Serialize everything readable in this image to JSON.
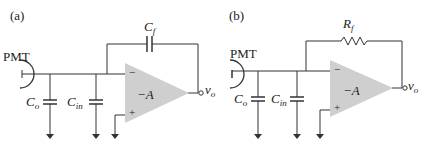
{
  "panels": [
    {
      "label": "(a)",
      "source": "PMT",
      "feedback": {
        "symbol": "C",
        "sub": "f",
        "type": "capacitor"
      },
      "caps": [
        {
          "symbol": "C",
          "sub": "o"
        },
        {
          "symbol": "C",
          "sub": "in"
        }
      ],
      "amp_gain": "−A",
      "minus": "−",
      "plus": "+",
      "output": {
        "symbol": "v",
        "sub": "o"
      }
    },
    {
      "label": "(b)",
      "source": "PMT",
      "feedback": {
        "symbol": "R",
        "sub": "f",
        "type": "resistor"
      },
      "caps": [
        {
          "symbol": "C",
          "sub": "o"
        },
        {
          "symbol": "C",
          "sub": "in"
        }
      ],
      "amp_gain": "−A",
      "minus": "−",
      "plus": "+",
      "output": {
        "symbol": "v",
        "sub": "o"
      }
    }
  ],
  "colors": {
    "line": "#333333",
    "amp_fill": "#cfcfcf"
  }
}
